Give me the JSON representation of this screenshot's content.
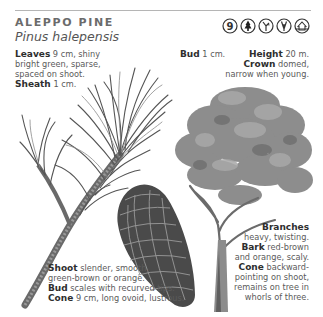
{
  "header": {
    "title": "ALEPPO PINE",
    "latin_name": "Pinus halepensis"
  },
  "icons": [
    {
      "name": "page-number-9-icon",
      "label": "9"
    },
    {
      "name": "conifer-tree-icon"
    },
    {
      "name": "branching-shoot-icon"
    },
    {
      "name": "upright-shoot-icon"
    },
    {
      "name": "habitat-house-icon"
    }
  ],
  "notes": {
    "leaves": {
      "label": "Leaves",
      "text_1": "9 cm, shiny",
      "text_2": "bright green, sparse,",
      "text_3": "spaced on shoot."
    },
    "sheath": {
      "label": "Sheath",
      "text": "1 cm."
    },
    "bud_top": {
      "label": "Bud",
      "text": "1 cm."
    },
    "height": {
      "label": "Height",
      "text": "20 m."
    },
    "crown": {
      "label": "Crown",
      "text_1": "domed,",
      "text_2": "narrow when young."
    },
    "branches": {
      "label": "Branches",
      "text": "heavy, twisting."
    },
    "bark": {
      "label": "Bark",
      "text_1": "red-brown",
      "text_2": "and orange, scaly."
    },
    "cone_right": {
      "label": "Cone",
      "text_1": "backward-",
      "text_2": "pointing on shoot,",
      "text_3": "remains on tree in",
      "text_4": "whorls of three."
    },
    "shoot": {
      "label": "Shoot",
      "text_1": "slender, smooth,",
      "text_2": "green-brown or orange."
    },
    "bud_bottom": {
      "label": "Bud",
      "text": "scales with recurved tips."
    },
    "cone_bottom": {
      "label": "Cone",
      "text": "9 cm, long ovoid, lustrous."
    }
  },
  "colors": {
    "text": "#5a5a5a",
    "label": "#2e2e2e",
    "title": "#6b6b6b",
    "rule": "#b5b5b5",
    "foliage": "#7a7a7a"
  }
}
